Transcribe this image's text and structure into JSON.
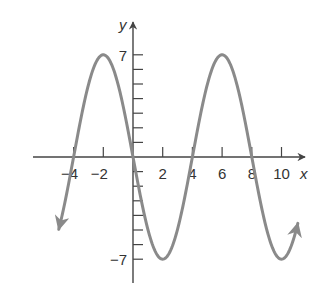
{
  "chart_data": {
    "type": "line",
    "title": "",
    "xlabel": "x",
    "ylabel": "y",
    "function": "y = -7 sin(pi x / 4)",
    "xlim": [
      -5,
      11
    ],
    "ylim": [
      -7,
      7
    ],
    "x_ticks": [
      -4,
      -2,
      2,
      4,
      6,
      8,
      10
    ],
    "x_tick_labels": [
      "−4",
      "−2",
      "2",
      "4",
      "6",
      "8",
      "10"
    ],
    "y_ticks_labeled": [
      7,
      -7
    ],
    "y_tick_labels": [
      "7",
      "−7"
    ],
    "y_minor_tick_step": 1,
    "key_points": [
      {
        "x": -4,
        "y": 0
      },
      {
        "x": -2,
        "y": 7
      },
      {
        "x": 0,
        "y": 0
      },
      {
        "x": 2,
        "y": -7
      },
      {
        "x": 4,
        "y": 0
      },
      {
        "x": 6,
        "y": 7
      },
      {
        "x": 8,
        "y": 0
      },
      {
        "x": 10,
        "y": -7
      }
    ],
    "grid": false,
    "curve_color": "#8a8a8a",
    "axis_color": "#444444"
  }
}
